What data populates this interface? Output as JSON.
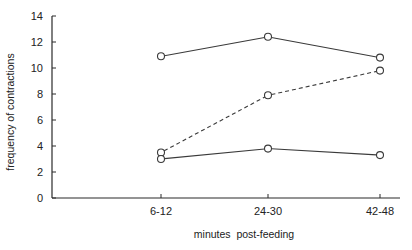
{
  "chart_data": {
    "type": "line",
    "title": "",
    "xlabel": "minutes  post-feeding",
    "ylabel": "frequency of contractions",
    "categories": [
      "6-12",
      "24-30",
      "42-48"
    ],
    "ylim": [
      0,
      14
    ],
    "yticks": [
      0,
      2,
      4,
      6,
      8,
      10,
      12,
      14
    ],
    "grid": false,
    "legend": null,
    "marker": "open-circle",
    "series": [
      {
        "name": "upper solid",
        "style": "solid",
        "values": [
          10.9,
          12.4,
          10.8
        ]
      },
      {
        "name": "dashed",
        "style": "dashed",
        "values": [
          3.5,
          7.9,
          9.8
        ]
      },
      {
        "name": "lower solid",
        "style": "solid",
        "values": [
          3.0,
          3.8,
          3.3
        ]
      }
    ]
  },
  "colors": {
    "line": "#3a3a3a",
    "axis": "#2a2a2a",
    "text": "#222222",
    "background": "#ffffff"
  }
}
